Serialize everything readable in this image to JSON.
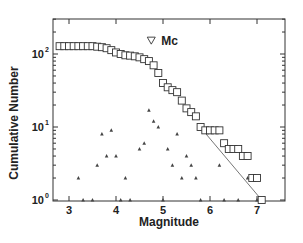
{
  "chart_data": {
    "type": "scatter",
    "title": "",
    "xlabel": "Magnitude",
    "ylabel": "Cumulative Number",
    "xlim": [
      2.75,
      7.4
    ],
    "ylim": [
      0.9,
      200
    ],
    "yscale": "log",
    "xticks": [
      3,
      4,
      5,
      6,
      7
    ],
    "yticks": [
      {
        "value": 1,
        "base": "10",
        "exp": "0"
      },
      {
        "value": 10,
        "base": "10",
        "exp": "1"
      },
      {
        "value": 100,
        "base": "10",
        "exp": "2"
      }
    ],
    "grid": false,
    "annotations": [
      {
        "text": "Mc",
        "marker": "inverted-triangle",
        "x": 4.75,
        "y": 150
      }
    ],
    "series": [
      {
        "name": "Cumulative",
        "marker": "square-open",
        "x": [
          2.8,
          2.9,
          3.0,
          3.1,
          3.2,
          3.3,
          3.4,
          3.5,
          3.6,
          3.7,
          3.8,
          3.9,
          4.0,
          4.1,
          4.2,
          4.3,
          4.4,
          4.5,
          4.6,
          4.7,
          4.8,
          4.9,
          5.0,
          5.1,
          5.2,
          5.3,
          5.4,
          5.5,
          5.6,
          5.7,
          5.8,
          5.9,
          6.0,
          6.1,
          6.2,
          6.3,
          6.4,
          6.5,
          6.6,
          6.7,
          6.8,
          6.9,
          7.0,
          7.1
        ],
        "values": [
          128,
          128,
          128,
          128,
          128,
          128,
          128,
          128,
          126,
          124,
          120,
          113,
          105,
          100,
          96,
          95,
          93,
          90,
          85,
          80,
          70,
          55,
          40,
          35,
          32,
          30,
          23,
          18,
          16,
          14,
          10,
          9,
          9,
          9,
          9,
          6,
          5,
          5,
          5,
          4,
          4,
          2,
          2,
          1
        ]
      },
      {
        "name": "Non-cumulative",
        "marker": "triangle-small",
        "x": [
          3.2,
          3.3,
          3.5,
          3.6,
          3.7,
          3.8,
          3.9,
          4.0,
          4.1,
          4.2,
          4.3,
          4.5,
          4.6,
          4.7,
          4.8,
          4.9,
          5.0,
          5.1,
          5.2,
          5.3,
          5.4,
          5.5,
          5.6,
          5.7,
          5.8,
          6.2,
          6.3,
          6.6,
          6.8,
          7.0,
          7.1
        ],
        "values": [
          2,
          1,
          1,
          3,
          8,
          4,
          9,
          4,
          1,
          2,
          1,
          5,
          6,
          17,
          12,
          10,
          1,
          5,
          3,
          8,
          2,
          4,
          3,
          2,
          1,
          3,
          1,
          1,
          2,
          1,
          1
        ]
      },
      {
        "name": "Fit line",
        "marker": "line",
        "x": [
          5.85,
          7.1
        ],
        "values": [
          9,
          1
        ]
      }
    ]
  }
}
